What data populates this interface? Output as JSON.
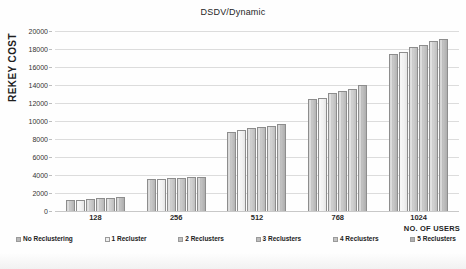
{
  "chart_data": {
    "type": "bar",
    "title": "DSDV/Dynamic",
    "xlabel": "NO. OF USERS",
    "ylabel": "REKEY COST",
    "categories": [
      "128",
      "256",
      "512",
      "768",
      "1024"
    ],
    "ylim": [
      0,
      20000
    ],
    "ytick_labels": [
      "0",
      "2000",
      "4000",
      "6000",
      "8000",
      "10000",
      "12000",
      "14000",
      "16000",
      "18000",
      "20000"
    ],
    "ytick_values": [
      0,
      2000,
      4000,
      6000,
      8000,
      10000,
      12000,
      14000,
      16000,
      18000,
      20000
    ],
    "grid": true,
    "legend_position": "bottom",
    "series": [
      {
        "name": "No Reclustering",
        "values": [
          1250,
          3560,
          8800,
          12400,
          17400
        ]
      },
      {
        "name": "1 Recluster",
        "values": [
          1270,
          3600,
          9000,
          12600,
          17700
        ]
      },
      {
        "name": "2 Reclusters",
        "values": [
          1380,
          3640,
          9250,
          13100,
          18200
        ]
      },
      {
        "name": "3 Reclusters",
        "values": [
          1400,
          3700,
          9300,
          13350,
          18450
        ]
      },
      {
        "name": "4 Reclusters",
        "values": [
          1430,
          3750,
          9500,
          13550,
          18850
        ]
      },
      {
        "name": "5 Reclusters",
        "values": [
          1540,
          3790,
          9650,
          14000,
          19080
        ]
      }
    ],
    "series_colors": [
      "#b9b9b9",
      "#eeeeee",
      "#c0c0c0",
      "#bdbdbd",
      "#c4c4c4",
      "#b2b2b2"
    ]
  }
}
